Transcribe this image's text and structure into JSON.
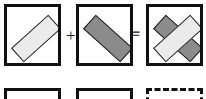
{
  "diagram": {
    "canvas": {
      "width": 206,
      "height": 99,
      "background": "#ffffff"
    },
    "colors": {
      "light_fill": "#ebebeb",
      "dark_fill": "#8b8b8b",
      "stroke": "#161616",
      "panel_border": "#111111",
      "background": "#ffffff"
    },
    "operators": [
      {
        "id": "plus",
        "symbol": "+",
        "name": "plus-operator",
        "x": 66,
        "y": 27
      },
      {
        "id": "equals",
        "symbol": "=",
        "name": "equals-operator",
        "x": 131,
        "y": 26
      }
    ],
    "panels": [
      {
        "id": "panel-1",
        "name": "panel-light-bar",
        "border_style": "solid",
        "x": 4,
        "y": 4,
        "width": 57,
        "height": 62,
        "shapes": [
          {
            "id": "shape-light-1",
            "name": "light-rectangle",
            "fill": "light",
            "rotation_deg": -42,
            "cx": 28.5,
            "cy": 31,
            "w": 50,
            "h": 19
          }
        ]
      },
      {
        "id": "panel-2",
        "name": "panel-dark-bar",
        "border_style": "solid",
        "x": 76,
        "y": 4,
        "width": 57,
        "height": 62,
        "shapes": [
          {
            "id": "shape-dark-1",
            "name": "dark-rectangle",
            "fill": "dark",
            "rotation_deg": 42,
            "cx": 28.5,
            "cy": 31,
            "w": 50,
            "h": 19
          }
        ]
      },
      {
        "id": "panel-3",
        "name": "panel-overlap-result",
        "border_style": "solid",
        "x": 146,
        "y": 4,
        "width": 57,
        "height": 62,
        "shapes": [
          {
            "id": "shape-dark-2",
            "name": "dark-rectangle",
            "fill": "dark",
            "rotation_deg": 42,
            "cx": 28.5,
            "cy": 31,
            "w": 50,
            "h": 19
          },
          {
            "id": "shape-light-2",
            "name": "light-rectangle",
            "fill": "light",
            "rotation_deg": -42,
            "cx": 28.5,
            "cy": 31,
            "w": 50,
            "h": 19
          }
        ]
      },
      {
        "id": "panel-4",
        "name": "panel-row2-first",
        "border_style": "solid",
        "x": 4,
        "y": 88,
        "width": 57,
        "height": 62,
        "shapes": []
      },
      {
        "id": "panel-5",
        "name": "panel-row2-second",
        "border_style": "solid",
        "x": 76,
        "y": 88,
        "width": 57,
        "height": 62,
        "shapes": []
      },
      {
        "id": "panel-6",
        "name": "panel-row2-third-dashed",
        "border_style": "dashed",
        "x": 146,
        "y": 88,
        "width": 57,
        "height": 62,
        "shapes": []
      }
    ]
  }
}
